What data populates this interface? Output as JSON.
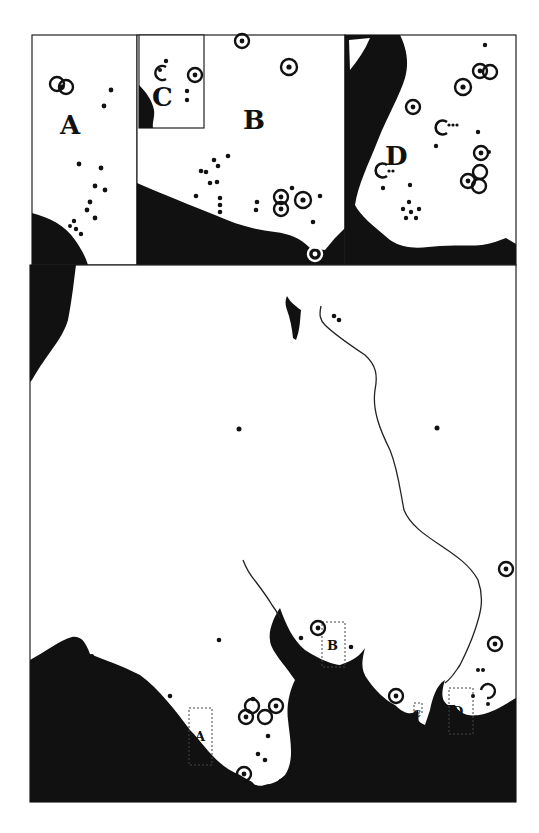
{
  "map": {
    "colors": {
      "land_sea_fill": "#111111",
      "background": "#ffffff",
      "stroke": "#222222"
    },
    "insets": [
      {
        "id": "A",
        "label": "A"
      },
      {
        "id": "B",
        "label": "B"
      },
      {
        "id": "C",
        "label": "C"
      },
      {
        "id": "D",
        "label": "D"
      }
    ],
    "main_map_boxes": [
      {
        "id": "A",
        "label": "A"
      },
      {
        "id": "B",
        "label": "B"
      },
      {
        "id": "C",
        "label": "C"
      },
      {
        "id": "D",
        "label": "D"
      }
    ],
    "legend_symbols": {
      "dot": "small-site-dot",
      "ringed_dot": "major-site-ring",
      "open_ring": "partial-ring-site"
    }
  }
}
